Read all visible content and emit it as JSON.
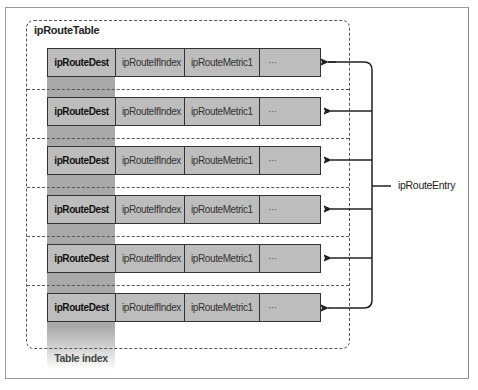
{
  "diagram": {
    "container_title": "ipRouteTable",
    "index_label": "Table index",
    "entry_label": "ipRouteEntry",
    "rows": [
      {
        "cells": [
          "ipRouteDest",
          "ipRouteIfIndex",
          "ipRouteMetric1",
          "···"
        ]
      },
      {
        "cells": [
          "ipRouteDest",
          "ipRouteIfIndex",
          "ipRouteMetric1",
          "···"
        ]
      },
      {
        "cells": [
          "ipRouteDest",
          "ipRouteIfIndex",
          "ipRouteMetric1",
          "···"
        ]
      },
      {
        "cells": [
          "ipRouteDest",
          "ipRouteIfIndex",
          "ipRouteMetric1",
          "···"
        ]
      },
      {
        "cells": [
          "ipRouteDest",
          "ipRouteIfIndex",
          "ipRouteMetric1",
          "···"
        ]
      },
      {
        "cells": [
          "ipRouteDest",
          "ipRouteIfIndex",
          "ipRouteMetric1",
          "···"
        ]
      }
    ],
    "colors": {
      "cell_fill": "#bdbdbd",
      "index_band": "#a9a9a9",
      "border": "#333333",
      "dashed": "#555555"
    }
  }
}
